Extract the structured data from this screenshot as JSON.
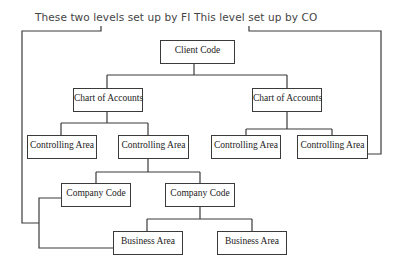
{
  "annotations": {
    "fi_label": "These two levels set up by FI",
    "co_label": "This level set up by CO"
  },
  "nodes": {
    "client_code": "Client Code",
    "chart_of_accounts_left": "Chart of Accounts",
    "chart_of_accounts_right": "Chart of Accounts",
    "controlling_area_1": "Controlling Area",
    "controlling_area_2": "Controlling Area",
    "controlling_area_3": "Controlling Area",
    "controlling_area_4": "Controlling Area",
    "company_code_1": "Company Code",
    "company_code_2": "Company Code",
    "business_area_1": "Business Area",
    "business_area_2": "Business Area"
  },
  "hierarchy": {
    "root": "Client Code",
    "children": [
      {
        "label": "Chart of Accounts",
        "children": [
          {
            "label": "Controlling Area"
          },
          {
            "label": "Controlling Area",
            "children": [
              {
                "label": "Company Code"
              },
              {
                "label": "Company Code",
                "children": [
                  {
                    "label": "Business Area"
                  },
                  {
                    "label": "Business Area"
                  }
                ]
              }
            ]
          }
        ]
      },
      {
        "label": "Chart of Accounts",
        "children": [
          {
            "label": "Controlling Area"
          },
          {
            "label": "Controlling Area"
          }
        ]
      }
    ]
  },
  "colors": {
    "line": "#3a3a3a",
    "annotation_text": "#444444",
    "background": "#ffffff"
  }
}
